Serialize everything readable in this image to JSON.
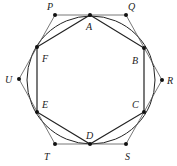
{
  "diagram": {
    "circle": {
      "cx": 91,
      "cy": 80,
      "r": 64
    },
    "inner_hexagon": [
      "A",
      "B",
      "C",
      "D",
      "E",
      "F"
    ],
    "outer_hexagon": [
      "P",
      "Q",
      "R",
      "S",
      "T",
      "U"
    ],
    "points": {
      "A": {
        "x": 90,
        "y": 15,
        "label": "A",
        "lx": 86,
        "ly": 30
      },
      "B": {
        "x": 144,
        "y": 48,
        "label": "B",
        "lx": 132,
        "ly": 64
      },
      "C": {
        "x": 144,
        "y": 112,
        "label": "C",
        "lx": 132,
        "ly": 108
      },
      "D": {
        "x": 90,
        "y": 144,
        "label": "D",
        "lx": 86,
        "ly": 139
      },
      "E": {
        "x": 37,
        "y": 112,
        "label": "E",
        "lx": 42,
        "ly": 108
      },
      "F": {
        "x": 37,
        "y": 47,
        "label": "F",
        "lx": 42,
        "ly": 62
      },
      "P": {
        "x": 55,
        "y": 15,
        "label": "P",
        "lx": 47,
        "ly": 10
      },
      "Q": {
        "x": 126,
        "y": 15,
        "label": "Q",
        "lx": 128,
        "ly": 10
      },
      "R": {
        "x": 162,
        "y": 80,
        "label": "R",
        "lx": 167,
        "ly": 84
      },
      "S": {
        "x": 126,
        "y": 144,
        "label": "S",
        "lx": 125,
        "ly": 160
      },
      "T": {
        "x": 55,
        "y": 144,
        "label": "T",
        "lx": 44,
        "ly": 160
      },
      "U": {
        "x": 19,
        "y": 79,
        "label": "U",
        "lx": 5,
        "ly": 83
      }
    },
    "colors": {
      "stroke": "#222222",
      "thin_stroke": "#555555",
      "point": "#111111"
    }
  }
}
